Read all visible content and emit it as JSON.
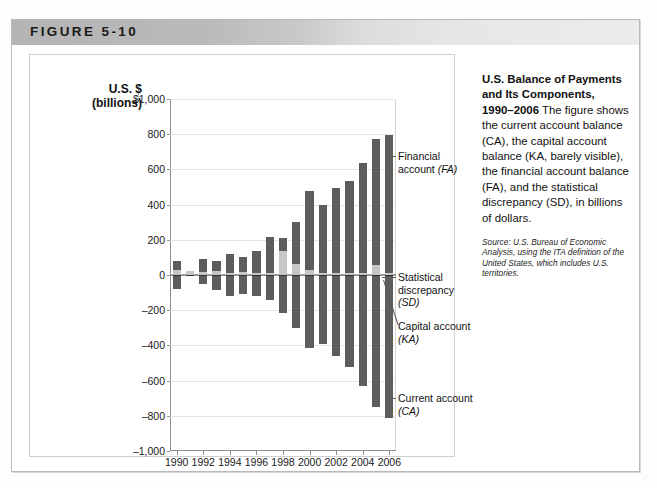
{
  "figure": {
    "banner_label": "FIGURE 5-10"
  },
  "chart_data": {
    "type": "bar",
    "subtype": "stacked-diverging",
    "title": "U.S. Balance of Payments and Its Components, 1990–2006",
    "xlabel": "",
    "ylabel": "U.S. $ (billions)",
    "ylabel_line1": "U.S. $",
    "ylabel_line2": "(billions)",
    "ylim": [
      -1000,
      1000
    ],
    "ytick_step": 200,
    "ytick_labels": [
      "$1,000",
      "800",
      "600",
      "400",
      "200",
      "0",
      "–200",
      "–400",
      "–600",
      "–800",
      "–1,000"
    ],
    "ytick_values": [
      1000,
      800,
      600,
      400,
      200,
      0,
      -200,
      -400,
      -600,
      -800,
      -1000
    ],
    "grid": true,
    "legend": "annotations",
    "categories": [
      1990,
      1991,
      1992,
      1993,
      1994,
      1995,
      1996,
      1997,
      1998,
      1999,
      2000,
      2001,
      2002,
      2003,
      2004,
      2005,
      2006
    ],
    "xtick_labels": [
      "1990",
      "1992",
      "1994",
      "1996",
      "1998",
      "2000",
      "2002",
      "2004",
      "2006"
    ],
    "xtick_values": [
      1990,
      1992,
      1994,
      1996,
      1998,
      2000,
      2002,
      2004,
      2006
    ],
    "series": [
      {
        "name": "Financial account (FA)",
        "abbr": "FA",
        "color": "#5d5d5d",
        "values": [
          80,
          20,
          90,
          80,
          120,
          105,
          135,
          215,
          210,
          300,
          480,
          395,
          495,
          535,
          635,
          770,
          795
        ]
      },
      {
        "name": "Statistical discrepancy (SD)",
        "abbr": "SD",
        "color": "#c6c6c6",
        "values": [
          28,
          22,
          18,
          20,
          14,
          18,
          12,
          14,
          135,
          60,
          30,
          10,
          10,
          12,
          10,
          55,
          10
        ]
      },
      {
        "name": "Capital account (KA)",
        "abbr": "KA",
        "color": "#2e2e2e",
        "values": [
          -8,
          -5,
          -1,
          -1,
          -2,
          -1,
          -1,
          -1,
          -1,
          -5,
          -1,
          -1,
          -1,
          -3,
          -2,
          -4,
          -4
        ]
      },
      {
        "name": "Current account (CA)",
        "abbr": "CA",
        "color": "#5d5d5d",
        "values": [
          -80,
          -5,
          -50,
          -85,
          -122,
          -110,
          -120,
          -140,
          -215,
          -300,
          -415,
          -390,
          -460,
          -520,
          -630,
          -750,
          -812
        ]
      }
    ],
    "annotations": [
      {
        "id": "fa",
        "label_line1": "Financial",
        "label_line2": "account",
        "abbr": "(FA)"
      },
      {
        "id": "sd",
        "label_line1": "Statistical",
        "label_line2": "discrepancy",
        "abbr": "(SD)"
      },
      {
        "id": "ka",
        "label_line1": "Capital account",
        "label_line2": "",
        "abbr": "(KA)"
      },
      {
        "id": "ca",
        "label_line1": "Current account",
        "label_line2": "",
        "abbr": "(CA)"
      }
    ]
  },
  "caption": {
    "title_line1": "U.S. Balance of Payments",
    "title_line2": "and Its Components,",
    "title_line3": "1990–2006",
    "body": " The figure shows the current account balance (CA), the capital account balance (KA, barely visible), the financial account balance (FA), and the statistical discrepancy (SD), in billions of dollars.",
    "source": "Source: U.S. Bureau of Economic Analysis, using the ITA definition of the United States, which includes U.S. territories."
  },
  "colors": {
    "bar_dark": "#5d5d5d",
    "bar_light": "#c6c6c6",
    "bar_black": "#2e2e2e",
    "grid": "#e4e4e4",
    "axis": "#8e8e8e",
    "banner": "#c0c0c0"
  }
}
